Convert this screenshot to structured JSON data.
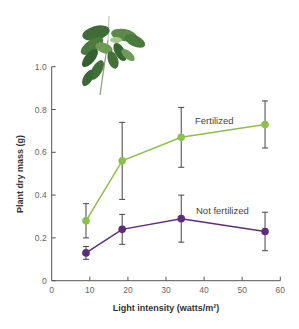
{
  "chart_data": {
    "type": "line",
    "title": "",
    "xlabel": "Light intensity (watts/m²)",
    "ylabel": "Plant dry mass (g)",
    "xlim": [
      0,
      60
    ],
    "ylim": [
      0,
      1.0
    ],
    "xticks": [
      0,
      10,
      20,
      30,
      40,
      50,
      60
    ],
    "yticks": [
      0,
      0.2,
      0.4,
      0.6,
      0.8,
      1.0
    ],
    "xtick_labels": [
      "0",
      "10",
      "20",
      "30",
      "40",
      "50",
      "60"
    ],
    "ytick_labels": [
      "0",
      "0.2",
      "0.4",
      "0.6",
      "0.8",
      "1.0"
    ],
    "grid": false,
    "legend": "inline labels",
    "x": [
      9,
      18.5,
      34,
      56
    ],
    "series": [
      {
        "name": "Fertilized",
        "color": "#8dc04a",
        "values": [
          0.28,
          0.56,
          0.67,
          0.73
        ],
        "error_low": [
          0.2,
          0.38,
          0.53,
          0.62
        ],
        "error_high": [
          0.36,
          0.74,
          0.81,
          0.84
        ],
        "label_pos": {
          "x": 36,
          "y": 0.74
        }
      },
      {
        "name": "Not fertilized",
        "color": "#5b2d7a",
        "values": [
          0.13,
          0.24,
          0.29,
          0.23
        ],
        "error_low": [
          0.1,
          0.17,
          0.18,
          0.14
        ],
        "error_high": [
          0.16,
          0.31,
          0.4,
          0.32
        ],
        "label_pos": {
          "x": 36,
          "y": 0.32
        }
      }
    ],
    "annotations": [
      "Fertilized",
      "Not fertilized"
    ],
    "decoration": "plant-illustration"
  },
  "labels": {
    "series_0": "Fertilized",
    "series_1": "Not fertilized",
    "xlabel": "Light intensity (watts/m²)",
    "ylabel": "Plant dry mass (g)"
  }
}
